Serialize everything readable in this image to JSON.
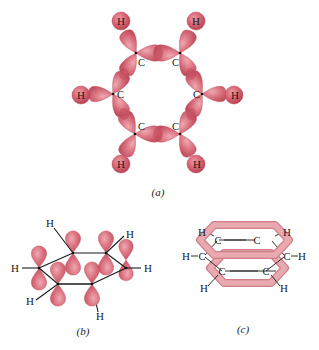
{
  "figure": {
    "panels": [
      {
        "id": "a",
        "caption": "(a)",
        "description": "Sigma-bond framework of benzene: sp2 hybrid orbitals of six carbons overlapping with each other and with hydrogen 1s orbitals",
        "atoms": {
          "carbon_label": "C",
          "hydrogen_label": "H",
          "carbons": [
            {
              "x": 136,
              "y": 53
            },
            {
              "x": 180,
              "y": 53
            },
            {
              "x": 202,
              "y": 94
            },
            {
              "x": 180,
              "y": 134
            },
            {
              "x": 135,
              "y": 134
            },
            {
              "x": 113,
              "y": 94
            }
          ],
          "hydrogens": [
            {
              "x": 121,
              "y": 21
            },
            {
              "x": 196,
              "y": 21
            },
            {
              "x": 234,
              "y": 95
            },
            {
              "x": 196,
              "y": 164
            },
            {
              "x": 121,
              "y": 164
            },
            {
              "x": 81,
              "y": 95
            }
          ]
        }
      },
      {
        "id": "b",
        "caption": "(b)",
        "description": "Unhybridized p orbitals perpendicular to the benzene ring plane",
        "labels": {
          "hydrogen": "H"
        }
      },
      {
        "id": "c",
        "caption": "(c)",
        "description": "Delocalized pi electron clouds above and below the plane of the ring",
        "labels": {
          "carbon": "C",
          "hydrogen": "H"
        }
      }
    ],
    "colors": {
      "orbital_fill": "#d9707e",
      "orbital_dark": "#c2505f",
      "orbital_light": "#eba3ac",
      "ring_fill": "#e3a0a6",
      "ring_stroke": "#cf7d86",
      "bond_line": "#1a1a1a"
    }
  }
}
